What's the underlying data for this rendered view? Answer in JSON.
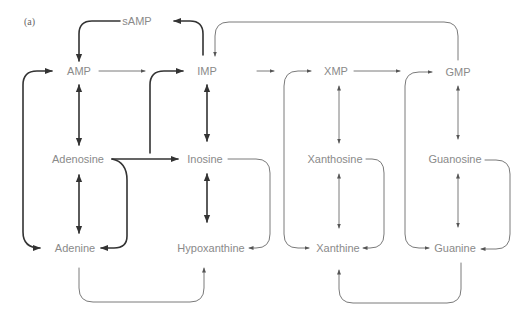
{
  "panel_label": "(a)",
  "colors": {
    "text": "#8a8a8a",
    "thick_line": "#333333",
    "thin_line": "#7a7a7a"
  },
  "nodes": {
    "samp": {
      "label": "sAMP",
      "x": 137,
      "y": 21
    },
    "amp": {
      "label": "AMP",
      "x": 79,
      "y": 71
    },
    "imp": {
      "label": "IMP",
      "x": 207,
      "y": 71
    },
    "xmp": {
      "label": "XMP",
      "x": 336,
      "y": 71
    },
    "gmp": {
      "label": "GMP",
      "x": 458,
      "y": 72
    },
    "adenosine": {
      "label": "Adenosine",
      "x": 78,
      "y": 159
    },
    "inosine": {
      "label": "Inosine",
      "x": 205,
      "y": 159
    },
    "xanthosine": {
      "label": "Xanthosine",
      "x": 335,
      "y": 159
    },
    "guanosine": {
      "label": "Guanosine",
      "x": 455,
      "y": 159
    },
    "adenine": {
      "label": "Adenine",
      "x": 75,
      "y": 248
    },
    "hypoxanthine": {
      "label": "Hypoxanthine",
      "x": 211,
      "y": 248
    },
    "xanthine": {
      "label": "Xanthine",
      "x": 338,
      "y": 248
    },
    "guanine": {
      "label": "Guanine",
      "x": 455,
      "y": 248
    }
  },
  "edges": [
    {
      "from": "samp",
      "to": "amp",
      "style": "thick"
    },
    {
      "from": "imp",
      "to": "samp",
      "style": "thick"
    },
    {
      "from": "gmp",
      "to": "imp",
      "style": "thin"
    },
    {
      "from": "amp",
      "to": "imp",
      "style": "thin"
    },
    {
      "from": "imp",
      "to": "xmp",
      "style": "thin"
    },
    {
      "from": "xmp",
      "to": "gmp",
      "style": "thin"
    },
    {
      "from": "adenine",
      "to": "amp",
      "style": "thick"
    },
    {
      "from": "hypoxanthine",
      "to": "imp",
      "style": "thick"
    },
    {
      "from": "xanthine",
      "to": "xmp",
      "style": "thin"
    },
    {
      "from": "guanine",
      "to": "gmp",
      "style": "thin"
    },
    {
      "from": "amp",
      "to": "adenosine",
      "style": "thick",
      "bidirectional": true
    },
    {
      "from": "imp",
      "to": "inosine",
      "style": "thick",
      "bidirectional": true
    },
    {
      "from": "xmp",
      "to": "xanthosine",
      "style": "thin",
      "bidirectional": true
    },
    {
      "from": "gmp",
      "to": "guanosine",
      "style": "thin",
      "bidirectional": true
    },
    {
      "from": "adenosine",
      "to": "adenine",
      "style": "thick",
      "bidirectional": true
    },
    {
      "from": "inosine",
      "to": "hypoxanthine",
      "style": "thick",
      "bidirectional": true
    },
    {
      "from": "xanthosine",
      "to": "xanthine",
      "style": "thin",
      "bidirectional": true
    },
    {
      "from": "guanosine",
      "to": "guanine",
      "style": "thin",
      "bidirectional": true
    },
    {
      "from": "adenosine",
      "to": "inosine",
      "style": "thick"
    },
    {
      "from": "adenosine",
      "to": "adenine",
      "style": "thick"
    },
    {
      "from": "inosine",
      "to": "hypoxanthine",
      "style": "thin"
    },
    {
      "from": "xanthosine",
      "to": "xanthine",
      "style": "thin"
    },
    {
      "from": "guanosine",
      "to": "guanine",
      "style": "thin"
    },
    {
      "from": "adenine",
      "to": "hypoxanthine",
      "style": "thin"
    },
    {
      "from": "guanine",
      "to": "xanthine",
      "style": "thin"
    }
  ]
}
